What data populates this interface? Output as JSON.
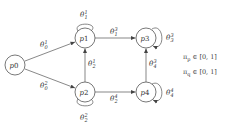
{
  "diagram": {
    "nodes": [
      {
        "id": "p0",
        "base": "p",
        "index": "0"
      },
      {
        "id": "p1",
        "base": "p",
        "index": "1"
      },
      {
        "id": "p2",
        "base": "p",
        "index": "2"
      },
      {
        "id": "p3",
        "base": "p",
        "index": "3"
      },
      {
        "id": "p4",
        "base": "p",
        "index": "4"
      }
    ],
    "edges": [
      {
        "from": "p0",
        "to": "p1",
        "label": {
          "base": "θ",
          "sub": "0",
          "sup": "1"
        }
      },
      {
        "from": "p0",
        "to": "p2",
        "label": {
          "base": "θ",
          "sub": "0",
          "sup": "2"
        }
      },
      {
        "from": "p1",
        "to": "p1",
        "label": {
          "base": "θ",
          "sub": "1",
          "sup": "1"
        }
      },
      {
        "from": "p2",
        "to": "p2",
        "label": {
          "base": "θ",
          "sub": "2",
          "sup": "2"
        }
      },
      {
        "from": "p2",
        "to": "p1",
        "label": {
          "base": "θ",
          "sub": "2",
          "sup": "1"
        }
      },
      {
        "from": "p1",
        "to": "p3",
        "label": {
          "base": "θ",
          "sub": "1",
          "sup": "3"
        }
      },
      {
        "from": "p2",
        "to": "p4",
        "label": {
          "base": "θ",
          "sub": "2",
          "sup": "4"
        }
      },
      {
        "from": "p4",
        "to": "p3",
        "label": {
          "base": "θ",
          "sub": "4",
          "sup": "3"
        }
      },
      {
        "from": "p3",
        "to": "p3",
        "label": {
          "base": "θ",
          "sub": "3",
          "sup": "3"
        }
      },
      {
        "from": "p4",
        "to": "p4",
        "label": {
          "base": "θ",
          "sub": "4",
          "sup": "4"
        }
      }
    ],
    "parameters": [
      {
        "symbol": "π",
        "sub": "p",
        "text": " ∈ [0, 1]"
      },
      {
        "symbol": "π",
        "sub": "q",
        "text": " ∈ [0, 1]"
      }
    ]
  }
}
